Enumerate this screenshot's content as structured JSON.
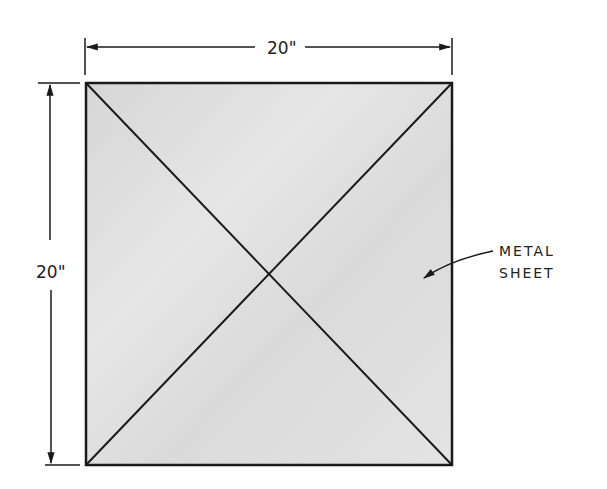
{
  "diagram": {
    "top_dimension": "20\"",
    "left_dimension": "20\"",
    "callout": {
      "line1": "METAL",
      "line2": "SHEET"
    },
    "colors": {
      "sheet_fill": "#dcdcdc",
      "line": "#1a1a1a",
      "background": "#ffffff"
    }
  }
}
